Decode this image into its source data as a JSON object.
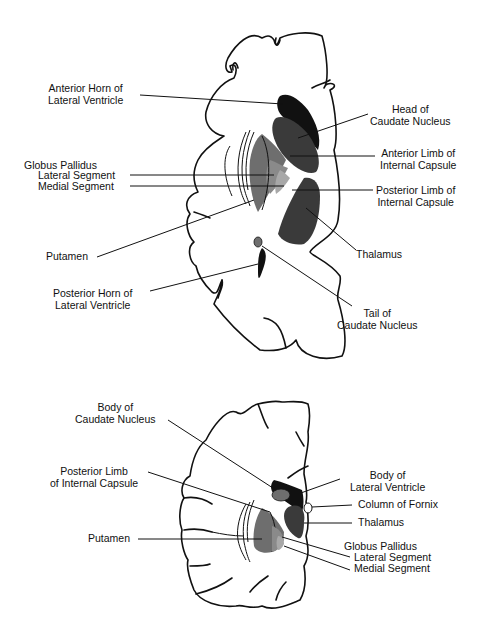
{
  "figure": {
    "top_panel": {
      "description": "Horizontal section of cerebral hemisphere through basal ganglia",
      "labels": {
        "anterior_horn": [
          "Anterior Horn of",
          "Lateral Ventricle"
        ],
        "head_caudate": [
          "Head of",
          "Caudate Nucleus"
        ],
        "anterior_limb": [
          "Anterior Limb of",
          "Internal Capsule"
        ],
        "globus_pallidus": "Globus Pallidus",
        "lateral_segment": "Lateral Segment",
        "medial_segment": "Medial Segment",
        "posterior_limb": [
          "Posterior Limb of",
          "Internal Capsule"
        ],
        "putamen": "Putamen",
        "thalamus": "Thalamus",
        "posterior_horn": [
          "Posterior Horn of",
          "Lateral Ventricle"
        ],
        "tail_caudate": [
          "Tail of",
          "Caudate Nucleus"
        ]
      }
    },
    "bottom_panel": {
      "description": "Coronal section of cerebral hemisphere through basal ganglia",
      "labels": {
        "body_caudate": [
          "Body of",
          "Caudate Nucleus"
        ],
        "posterior_limb": [
          "Posterior Limb",
          "of Internal Capsule"
        ],
        "putamen": "Putamen",
        "body_lateral_ventricle": [
          "Body of",
          "Lateral Ventricle"
        ],
        "column_fornix": "Column of Fornix",
        "thalamus": "Thalamus",
        "globus_pallidus": "Globus Pallidus",
        "lateral_segment": "Lateral Segment",
        "medial_segment": "Medial Segment"
      }
    },
    "colors": {
      "ventricle": "#111111",
      "caudate": "#3a3a3a",
      "thalamus": "#3a3a3a",
      "putamen": "#6e6e6e",
      "gp_lateral": "#8a8a8a",
      "gp_medial": "#a8a8a8",
      "outline": "#111111"
    }
  }
}
